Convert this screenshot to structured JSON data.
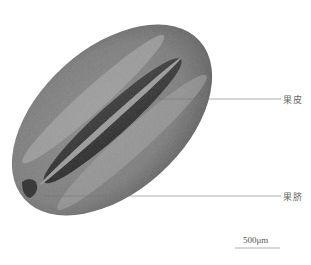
{
  "figure": {
    "annotations": [
      {
        "label": "果皮",
        "x": 282,
        "y": 99
      },
      {
        "label": "果脐",
        "x": 282,
        "y": 196
      }
    ],
    "scale_bar": {
      "label": "500μm",
      "length_px": 45
    }
  },
  "colors": {
    "background": "#ffffff",
    "seed_dark": "#2a2a2a",
    "seed_mid": "#6e6e6e",
    "seed_light": "#a8a8a8",
    "leader": "#777777"
  }
}
